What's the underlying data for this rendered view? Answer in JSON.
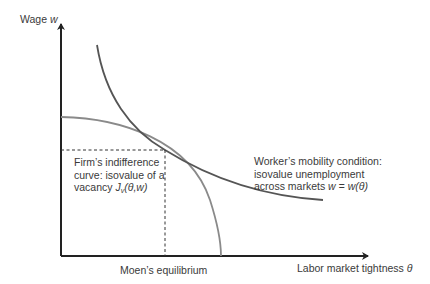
{
  "diagram": {
    "y_axis_label": {
      "text": "Wage ",
      "var": "w"
    },
    "x_axis_label": {
      "text": "Labor market tightness ",
      "var": "θ"
    },
    "equilibrium_label": "Moen’s equilibrium",
    "firm_curve_label": {
      "line1": "Firm’s indifference",
      "line2": "curve: isovalue of a",
      "line3_prefix": "vacancy ",
      "line3_func": "J",
      "line3_sub": "v",
      "line3_args": "(θ,w)"
    },
    "worker_curve_label": {
      "line1": "Worker’s mobility condition:",
      "line2": "isovalue unemployment",
      "line3_prefix": "across markets ",
      "line3_formula": "w = w(θ)"
    },
    "colors": {
      "axis": "#222222",
      "worker_curve": "#555555",
      "firm_curve": "#8a8a8a",
      "dashed": "#333333"
    }
  }
}
